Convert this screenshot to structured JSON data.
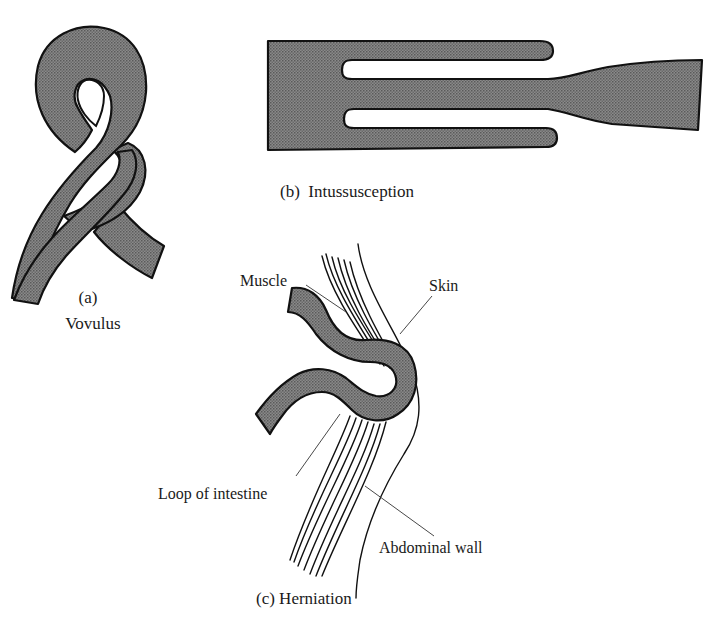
{
  "figure": {
    "fill_color": "#7a7a7a",
    "stroke_color": "#111111",
    "background": "#ffffff"
  },
  "panels": {
    "a": {
      "letter": "(a)",
      "title": "Vovulus"
    },
    "b": {
      "caption": "(b)  Intussusception"
    },
    "c": {
      "caption": "(c) Herniation",
      "labels": {
        "muscle": "Muscle",
        "skin": "Skin",
        "loop": "Loop of intestine",
        "wall": "Abdominal wall"
      }
    }
  }
}
